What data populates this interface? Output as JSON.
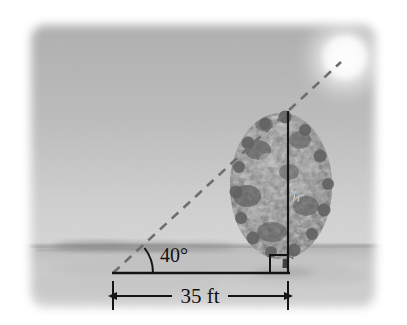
{
  "figure": {
    "kind": "trigonometry-word-problem-illustration",
    "labels": {
      "angle_of_elevation": "40°",
      "ground_distance": "35 ft",
      "tree_height": "h"
    },
    "elements": {
      "sun_name": "sun",
      "tree_name": "tree",
      "ground_name": "ground",
      "sky_name": "sky",
      "sight_line_name": "line-of-sight",
      "right_angle_name": "right-angle-marker"
    },
    "colors": {
      "sky_top": "#b2b2b2",
      "sky_bottom": "#cfcfcf",
      "ground": "#c9c9c9",
      "horizon": "#9a9a9a",
      "ink": "#1a1a1a",
      "dashed_line": "#6e6e6e",
      "sun_core": "#ffffff",
      "sun_glow": "#e8e8e8",
      "foliage_dark": "#4f4f4f",
      "foliage_mid": "#7b7b7b",
      "foliage_light": "#a9a9a9",
      "page_background": "#ffffff"
    },
    "geometry": {
      "photo_rect": {
        "x": 28,
        "y": 22,
        "width": 350,
        "height": 288
      },
      "horizon_y": 246,
      "baseline_y": 273,
      "vertex_x": 113,
      "tree_base_x": 288,
      "tree_top_y": 111,
      "dimension_line_y": 296,
      "sun_center": {
        "x": 345,
        "y": 58
      },
      "sun_radius": 27,
      "angle_degrees": 40
    }
  }
}
